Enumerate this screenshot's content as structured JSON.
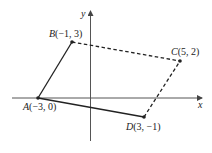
{
  "diagram": {
    "type": "coordinate-plane-quadrilateral",
    "axes": {
      "x_label": "x",
      "y_label": "y"
    },
    "points": [
      {
        "id": "A",
        "name": "A",
        "coords": "(−3, 0)",
        "x": -3,
        "y": 0
      },
      {
        "id": "B",
        "name": "B",
        "coords": "(−1, 3)",
        "x": -1,
        "y": 3
      },
      {
        "id": "C",
        "name": "C",
        "coords": "(5, 2)",
        "x": 5,
        "y": 2
      },
      {
        "id": "D",
        "name": "D",
        "coords": "(3, −1)",
        "x": 3,
        "y": -1
      }
    ],
    "segments": [
      {
        "from": "A",
        "to": "B",
        "style": "solid"
      },
      {
        "from": "A",
        "to": "D",
        "style": "solid"
      },
      {
        "from": "B",
        "to": "C",
        "style": "dashed"
      },
      {
        "from": "D",
        "to": "C",
        "style": "dashed"
      }
    ],
    "colors": {
      "line": "#222222",
      "axis": "#555555"
    }
  }
}
